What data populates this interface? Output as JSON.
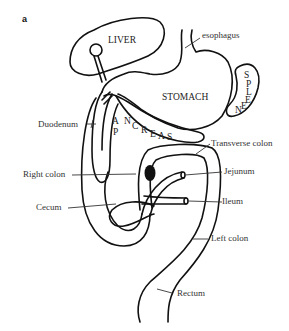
{
  "figure": {
    "panel_letter": "a"
  },
  "organs": {
    "liver": "LIVER",
    "stomach": "STOMACH",
    "spleen_letters": [
      "S",
      "P",
      "L",
      "E",
      "E",
      "N"
    ],
    "pancreas_letters": [
      "P",
      "A",
      "N",
      "C",
      "R",
      "E",
      "A",
      "S"
    ]
  },
  "labels": {
    "esophagus": "esophagus",
    "duodenum": "Duodenum",
    "transverse_colon": "Transverse colon",
    "right_colon": "Right colon",
    "jejunum": "Jejunum",
    "cecum": "Cecum",
    "ileum": "Ileum",
    "left_colon": "Left colon",
    "rectum": "Rectum"
  },
  "colors": {
    "stroke": "#111111",
    "label": "#333333",
    "background": "#ffffff"
  }
}
